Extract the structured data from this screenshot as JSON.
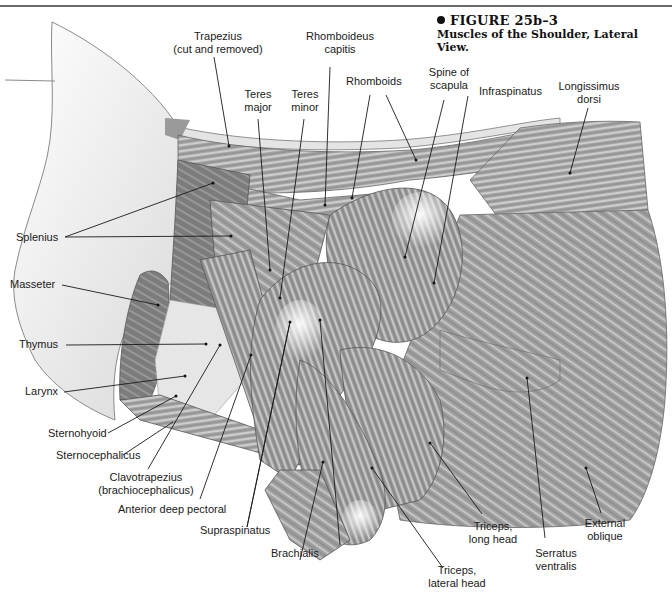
{
  "figure": {
    "number": "FIGURE 25b–3",
    "caption": "Muscles of the Shoulder, Lateral View."
  },
  "labels": {
    "trapezius_1": "Trapezius",
    "trapezius_2": "(cut and removed)",
    "rhomboideus_capitis_1": "Rhomboideus",
    "rhomboideus_capitis_2": "capitis",
    "teres_major_1": "Teres",
    "teres_major_2": "major",
    "teres_minor_1": "Teres",
    "teres_minor_2": "minor",
    "rhomboids": "Rhomboids",
    "spine_of_scapula_1": "Spine of",
    "spine_of_scapula_2": "scapula",
    "infraspinatus": "Infraspinatus",
    "longissimus_dorsi_1": "Longissimus",
    "longissimus_dorsi_2": "dorsi",
    "splenius": "Splenius",
    "masseter": "Masseter",
    "thymus": "Thymus",
    "larynx": "Larynx",
    "sternohyoid": "Sternohyoid",
    "sternocephalicus": "Sternocephalicus",
    "clavotrapezius_1": "Clavotrapezius",
    "clavotrapezius_2": "(brachiocephalicus)",
    "anterior_deep_pectoral": "Anterior deep pectoral",
    "supraspinatus": "Supraspinatus",
    "brachialis": "Brachialis",
    "triceps_lateral_1": "Triceps,",
    "triceps_lateral_2": "lateral head",
    "triceps_long_1": "Triceps,",
    "triceps_long_2": "long head",
    "serratus_ventralis_1": "Serratus",
    "serratus_ventralis_2": "ventralis",
    "external_oblique_1": "External",
    "external_oblique_2": "oblique"
  },
  "colors": {
    "leader_line": "#1a1a1a",
    "muscle_dark": "#6e6e6e",
    "muscle_mid": "#9a9a9a",
    "muscle_light": "#c8c8c8",
    "rule": "#6a6a6a"
  }
}
